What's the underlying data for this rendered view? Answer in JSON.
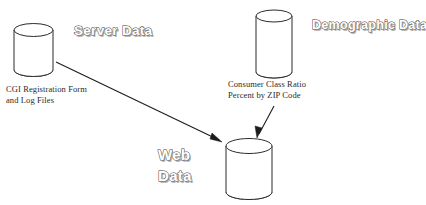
{
  "diagram": {
    "background_color": "#ffffff",
    "line_color": "#2b2b2b",
    "nodes": [
      {
        "id": "server-data",
        "heading": "Server Data",
        "caption": "CGI Registration Form\nand Log Files",
        "shape": "cylinder"
      },
      {
        "id": "demographic-data",
        "heading": "Demographic Data",
        "caption": "Consumer Class Ratio\nPercent by ZIP Code",
        "shape": "cylinder"
      },
      {
        "id": "web-data",
        "heading": "Web\nData",
        "caption": "",
        "shape": "cylinder"
      }
    ],
    "edges": [
      {
        "id": "server-to-web",
        "from": "server-data",
        "to": "web-data"
      },
      {
        "id": "demographic-to-web",
        "from": "demographic-data",
        "to": "web-data"
      }
    ]
  }
}
